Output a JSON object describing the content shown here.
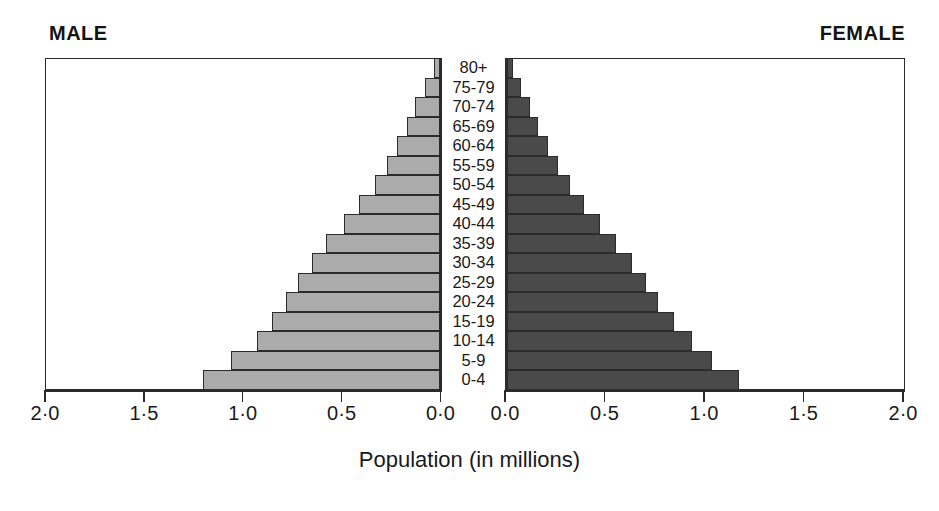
{
  "headings": {
    "male": "MALE",
    "female": "FEMALE"
  },
  "axis": {
    "caption": "Population (in millions)",
    "male_ticks": [
      "2·0",
      "1·5",
      "1·0",
      "0·5",
      "0·0"
    ],
    "female_ticks": [
      "0·0",
      "0·5",
      "1·0",
      "1·5",
      "2·0"
    ],
    "unit": "millions",
    "max": 2.0,
    "min": 0.0,
    "step": 0.5
  },
  "colors": {
    "male_bar": "#ababab",
    "female_bar": "#4a4a4a",
    "outline": "#2b2b2b",
    "background": "#ffffff",
    "text": "#1a1a1a"
  },
  "chart_data": {
    "type": "bar",
    "subtype": "population-pyramid",
    "title": "",
    "xlabel": "Population (in millions)",
    "ylabel": "",
    "xlim": [
      0,
      2.0
    ],
    "grid": false,
    "legend": "none",
    "orientation": "horizontal",
    "categories": [
      "0-4",
      "5-9",
      "10-14",
      "15-19",
      "20-24",
      "25-29",
      "30-34",
      "35-39",
      "40-44",
      "45-49",
      "50-54",
      "55-59",
      "60-64",
      "65-69",
      "70-74",
      "75-79",
      "80+"
    ],
    "series": [
      {
        "name": "MALE",
        "side": "left",
        "color": "#ababab",
        "values": [
          1.2,
          1.06,
          0.93,
          0.85,
          0.78,
          0.72,
          0.65,
          0.58,
          0.49,
          0.41,
          0.33,
          0.27,
          0.22,
          0.17,
          0.13,
          0.08,
          0.03
        ]
      },
      {
        "name": "FEMALE",
        "side": "right",
        "color": "#4a4a4a",
        "values": [
          1.17,
          1.03,
          0.93,
          0.84,
          0.76,
          0.7,
          0.63,
          0.55,
          0.47,
          0.39,
          0.32,
          0.26,
          0.21,
          0.16,
          0.12,
          0.07,
          0.03
        ]
      }
    ]
  }
}
